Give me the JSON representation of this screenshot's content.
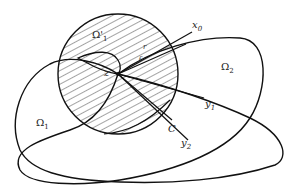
{
  "diagram": {
    "labels": {
      "omega_prime_1": {
        "base": "Ω",
        "prime": "'",
        "sub": "1"
      },
      "omega_1": {
        "base": "Ω",
        "sub": "1"
      },
      "omega_2": {
        "base": "Ω",
        "sub": "2"
      },
      "x0": {
        "base": "x",
        "sub": "0"
      },
      "y1": {
        "base": "y",
        "sub": "1"
      },
      "y2": {
        "base": "y",
        "sub": "2"
      },
      "C": "C",
      "z": "z",
      "r": "r",
      "epsilon": "ε"
    },
    "colors": {
      "stroke": "#111111",
      "hatch": "#333333",
      "background": "#ffffff"
    }
  }
}
